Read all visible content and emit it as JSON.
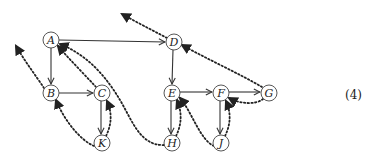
{
  "diagram": {
    "nodes": [
      {
        "id": "A",
        "label": "A",
        "x": 51,
        "y": 40
      },
      {
        "id": "B",
        "label": "B",
        "x": 51,
        "y": 93
      },
      {
        "id": "C",
        "label": "C",
        "x": 102,
        "y": 93
      },
      {
        "id": "K",
        "label": "K",
        "x": 102,
        "y": 143
      },
      {
        "id": "D",
        "label": "D",
        "x": 174,
        "y": 42
      },
      {
        "id": "E",
        "label": "E",
        "x": 172,
        "y": 93
      },
      {
        "id": "F",
        "label": "F",
        "x": 221,
        "y": 93
      },
      {
        "id": "G",
        "label": "G",
        "x": 269,
        "y": 93
      },
      {
        "id": "H",
        "label": "H",
        "x": 172,
        "y": 143
      },
      {
        "id": "J",
        "label": "J",
        "x": 221,
        "y": 143
      }
    ],
    "solid_edges": [
      {
        "from": "A",
        "to": "B"
      },
      {
        "from": "A",
        "to": "D"
      },
      {
        "from": "B",
        "to": "C"
      },
      {
        "from": "C",
        "to": "K"
      },
      {
        "from": "D",
        "to": "E"
      },
      {
        "from": "E",
        "to": "F"
      },
      {
        "from": "E",
        "to": "H"
      },
      {
        "from": "F",
        "to": "G"
      },
      {
        "from": "F",
        "to": "J"
      }
    ],
    "dotted_edges": [
      {
        "from": "A",
        "to": "offscreen-upper-left",
        "style": "dotted"
      },
      {
        "from": "B",
        "to": "offscreen-left",
        "style": "dotted"
      },
      {
        "from": "C",
        "to": "A",
        "style": "dotted"
      },
      {
        "from": "K",
        "to": "B",
        "style": "dotted"
      },
      {
        "from": "K",
        "to": "C",
        "style": "dotted"
      },
      {
        "from": "H",
        "to": "A",
        "style": "dotted"
      },
      {
        "from": "H",
        "to": "E",
        "style": "dotted"
      },
      {
        "from": "J",
        "to": "E",
        "style": "dotted"
      },
      {
        "from": "J",
        "to": "F",
        "style": "dotted"
      },
      {
        "from": "G",
        "to": "F",
        "style": "dotted"
      },
      {
        "from": "G",
        "to": "D",
        "style": "dotted"
      },
      {
        "from": "D",
        "to": "offscreen-upper-left",
        "style": "dotted"
      }
    ]
  },
  "equation_label": "(4)"
}
